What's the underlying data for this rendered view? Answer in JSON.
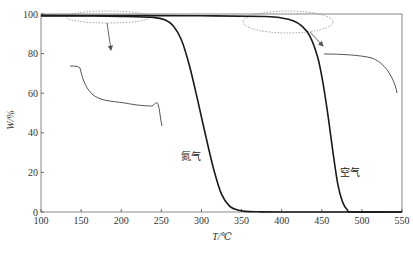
{
  "chart_data": {
    "type": "line",
    "title": "",
    "xlabel": "T/℃",
    "ylabel": "W/%",
    "xlim": [
      100,
      550
    ],
    "ylim": [
      0,
      100
    ],
    "xticks": [
      100,
      150,
      200,
      250,
      300,
      350,
      400,
      450,
      500,
      550
    ],
    "yticks": [
      0,
      20,
      40,
      60,
      80,
      100
    ],
    "grid": false,
    "legend": "none (curves labeled inline)",
    "series": [
      {
        "name": "氮气",
        "x": [
          100,
          150,
          200,
          240,
          255,
          265,
          275,
          285,
          295,
          305,
          315,
          325,
          335,
          345,
          355,
          370,
          400,
          550
        ],
        "y": [
          99,
          99,
          98.8,
          98.3,
          97,
          94,
          87,
          74,
          57,
          39,
          22,
          9,
          3,
          1,
          0.3,
          0.1,
          0,
          0
        ]
      },
      {
        "name": "空气",
        "x": [
          100,
          200,
          300,
          380,
          400,
          415,
          425,
          435,
          445,
          452,
          458,
          464,
          470,
          476,
          482,
          490,
          550
        ],
        "y": [
          99.3,
          99.2,
          99.1,
          98.7,
          98,
          96.5,
          94,
          89,
          78,
          64,
          48,
          30,
          14,
          5,
          1,
          0,
          0
        ]
      }
    ],
    "annotations": [
      {
        "text": "氮气",
        "x": 300,
        "y": 28,
        "target_series": "氮气"
      },
      {
        "text": "空气",
        "x": 463,
        "y": 20,
        "target_series": "空气"
      },
      {
        "type": "dashed-ellipse-zoom-inset",
        "region_x": [
          140,
          255
        ],
        "region_y": [
          97,
          100
        ],
        "inset": "left magnified view of 氮气 plateau"
      },
      {
        "type": "dashed-ellipse-zoom-inset",
        "region_x": [
          380,
          480
        ],
        "region_y": [
          93,
          100
        ],
        "inset": "right magnified view of 空气 plateau"
      }
    ]
  },
  "labels": {
    "xlabel": "T/℃",
    "ylabel": "W/%",
    "nitrogen": "氮气",
    "air": "空气"
  }
}
